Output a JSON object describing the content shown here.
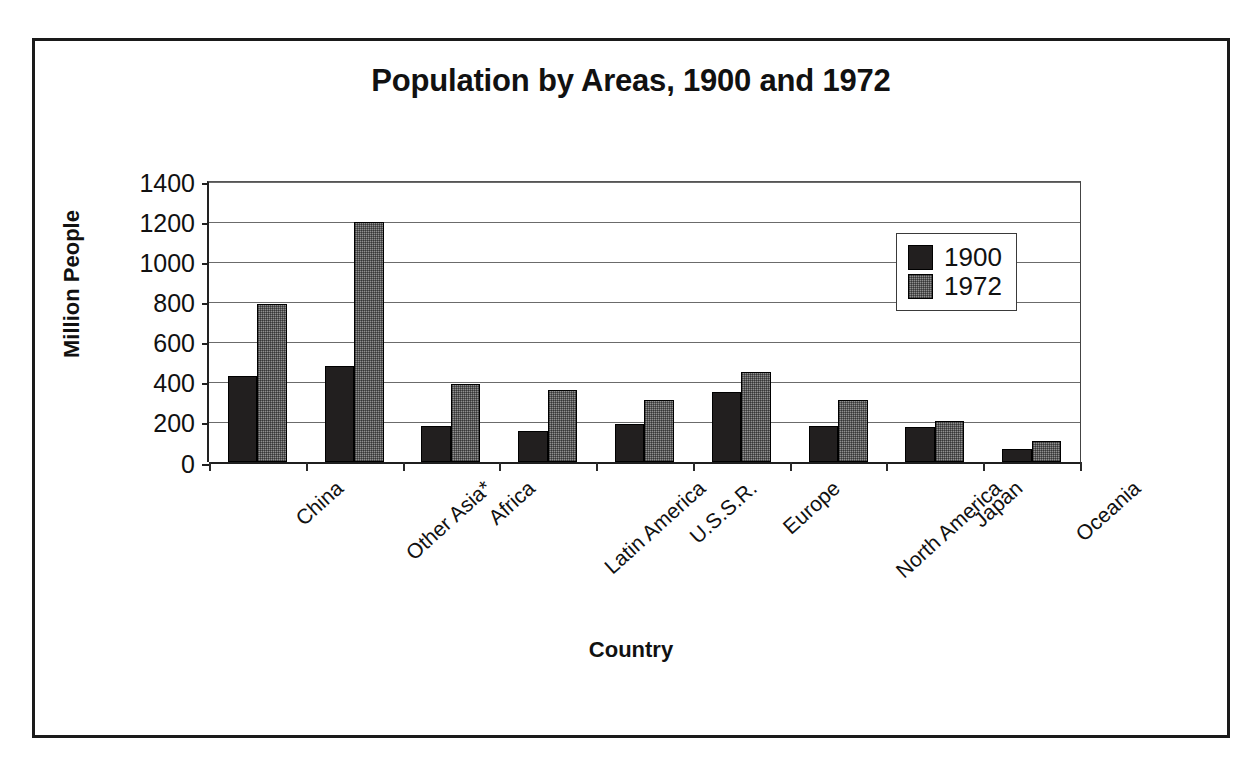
{
  "chart_data": {
    "type": "bar",
    "title": "Population by Areas, 1900 and 1972",
    "xlabel": "Country",
    "ylabel": "Million People",
    "categories": [
      "China",
      "Other Asia*",
      "Africa",
      "Latin America",
      "U.S.S.R.",
      "Europe",
      "North America",
      "Japan",
      "Oceania"
    ],
    "series": [
      {
        "name": "1900",
        "values": [
          430,
          480,
          180,
          155,
          190,
          350,
          180,
          175,
          65
        ]
      },
      {
        "name": "1972",
        "values": [
          790,
          1200,
          390,
          360,
          310,
          450,
          310,
          205,
          105
        ]
      }
    ],
    "ylim": [
      0,
      1400
    ],
    "ytick_labels": [
      "1400",
      "1200",
      "1000",
      "800",
      "600",
      "400",
      "200",
      "0"
    ],
    "ytick_values": [
      1400,
      1200,
      1000,
      800,
      600,
      400,
      200,
      0
    ],
    "grid": true,
    "legend_position": "upper right",
    "colors": {
      "series_1900": "#221f1f",
      "series_1972": "#8f8f8f",
      "axis": "#1f1f1f",
      "grid": "#6b6b6b",
      "text": "#111111"
    }
  }
}
